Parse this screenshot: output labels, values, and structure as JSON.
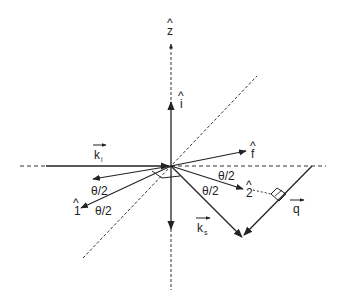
{
  "diagram": {
    "title": "",
    "colors": {
      "line": "#222222",
      "dash": "#333333",
      "background": "#ffffff"
    },
    "origin": {
      "x": 171,
      "y": 166
    },
    "axes": [
      {
        "name": "z-axis",
        "label": "ẑ",
        "style": "dashed",
        "direction": "vertical"
      },
      {
        "name": "horizontal-axis",
        "style": "dashed",
        "direction": "horizontal"
      },
      {
        "name": "diagonal-axis",
        "style": "dashed",
        "direction": "diagonal"
      }
    ],
    "labels": {
      "z_hat": "z",
      "i_hat": "i",
      "f_hat": "f",
      "one_hat": "1",
      "two_hat": "2",
      "k_i": "k",
      "k_i_sub": "i",
      "k_s": "k",
      "k_s_sub": "s",
      "q": "q",
      "hat": "^",
      "theta_half_1": "θ/2",
      "theta_half_2": "θ/2",
      "theta_half_3": "θ/2",
      "theta_half_4": "θ/2"
    },
    "vectors": [
      {
        "name": "k_i",
        "label": "k_i",
        "from": [
          46,
          166
        ],
        "to": [
          171,
          166
        ]
      },
      {
        "name": "i_hat",
        "label": "î",
        "from": [
          171,
          166
        ],
        "to": [
          171,
          100
        ]
      },
      {
        "name": "f_hat",
        "label": "f̂",
        "from": [
          171,
          166
        ],
        "to": [
          246,
          151
        ]
      },
      {
        "name": "two_hat",
        "label": "2̂",
        "from": [
          171,
          166
        ],
        "to": [
          243,
          189
        ]
      },
      {
        "name": "k_s",
        "label": "k_s",
        "from": [
          171,
          166
        ],
        "to": [
          242,
          237
        ]
      },
      {
        "name": "q",
        "label": "q",
        "from": [
          312,
          166
        ],
        "to": [
          242,
          237
        ]
      },
      {
        "name": "one_hat",
        "label": "1̂",
        "from": [
          171,
          166
        ],
        "to": [
          81,
          208
        ]
      },
      {
        "name": "minus_f",
        "from": [
          171,
          166
        ],
        "to": [
          93,
          179
        ]
      },
      {
        "name": "minus_z",
        "from": [
          171,
          166
        ],
        "to": [
          171,
          229
        ]
      }
    ]
  }
}
